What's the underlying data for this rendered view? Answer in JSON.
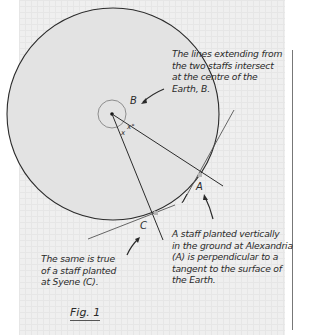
{
  "figure": {
    "caption": "Fig. 1",
    "points": {
      "center": {
        "label": "B",
        "x": 113,
        "y": 114
      },
      "alexandria": {
        "label": "A",
        "x": 199,
        "y": 172
      },
      "syene": {
        "label": "C",
        "x": 153,
        "y": 213
      }
    },
    "angle_label": "x°",
    "angle_label_2": "x",
    "colors": {
      "earth_fill": "#e3e3e3",
      "line": "#2b2b2b",
      "paper": "#efefef"
    }
  },
  "annotations": {
    "top_right": [
      "The lines extending from",
      "the two staffs intersect",
      "at the centre of the",
      "Earth, B."
    ],
    "bottom_right": [
      "A staff planted vertically",
      "in the ground at Alexandria",
      "(A) is perpendicular to a",
      "tangent to the surface of",
      "the Earth."
    ],
    "bottom_left": [
      "The same is true",
      "of a staff planted",
      "at Syene (C)."
    ]
  }
}
